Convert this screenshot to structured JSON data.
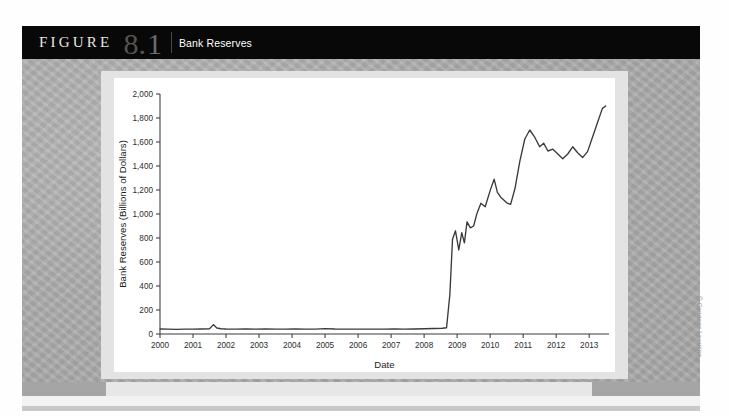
{
  "figure": {
    "label": "FIGURE",
    "chapter": "8",
    "dot": ".",
    "number": "1",
    "title": "Bank Reserves"
  },
  "credit": "© Cengage Learning",
  "chart_data": {
    "type": "line",
    "title": "Bank Reserves",
    "xlabel": "Date",
    "ylabel": "Bank Reserves (Billions of Dollars)",
    "xlim": [
      2000,
      2013.6
    ],
    "ylim": [
      0,
      2000
    ],
    "ytick_labels": [
      "0",
      "200",
      "400",
      "600",
      "800",
      "1,000",
      "1,200",
      "1,400",
      "1,600",
      "1,800",
      "2,000"
    ],
    "ytick_values": [
      0,
      200,
      400,
      600,
      800,
      1000,
      1200,
      1400,
      1600,
      1800,
      2000
    ],
    "xtick_labels": [
      "2000",
      "2001",
      "2002",
      "2003",
      "2004",
      "2005",
      "2006",
      "2007",
      "2008",
      "2009",
      "2010",
      "2011",
      "2012",
      "2013"
    ],
    "xtick_values": [
      2000,
      2001,
      2002,
      2003,
      2004,
      2005,
      2006,
      2007,
      2008,
      2009,
      2010,
      2011,
      2012,
      2013
    ],
    "grid": false,
    "legend": null,
    "series": [
      {
        "name": "Bank Reserves",
        "color": "#3a3a3a",
        "x": [
          2000.0,
          2000.25,
          2000.5,
          2000.75,
          2001.0,
          2001.25,
          2001.5,
          2001.62,
          2001.72,
          2001.85,
          2002.0,
          2002.3,
          2002.6,
          2002.9,
          2003.2,
          2003.5,
          2003.8,
          2004.1,
          2004.4,
          2004.7,
          2005.0,
          2005.3,
          2005.6,
          2005.9,
          2006.2,
          2006.5,
          2006.8,
          2007.1,
          2007.4,
          2007.7,
          2008.0,
          2008.3,
          2008.55,
          2008.68,
          2008.78,
          2008.86,
          2008.95,
          2009.05,
          2009.14,
          2009.22,
          2009.3,
          2009.4,
          2009.5,
          2009.6,
          2009.72,
          2009.85,
          2010.0,
          2010.12,
          2010.22,
          2010.32,
          2010.42,
          2010.52,
          2010.62,
          2010.75,
          2010.9,
          2011.05,
          2011.2,
          2011.35,
          2011.5,
          2011.62,
          2011.75,
          2011.9,
          2012.05,
          2012.2,
          2012.35,
          2012.5,
          2012.65,
          2012.8,
          2012.95,
          2013.1,
          2013.25,
          2013.4,
          2013.5
        ],
        "y": [
          42,
          40,
          38,
          41,
          40,
          42,
          44,
          78,
          50,
          44,
          42,
          40,
          42,
          41,
          42,
          40,
          41,
          42,
          41,
          40,
          45,
          42,
          41,
          40,
          41,
          40,
          41,
          42,
          41,
          42,
          44,
          46,
          48,
          52,
          330,
          790,
          860,
          700,
          845,
          760,
          935,
          885,
          900,
          1005,
          1090,
          1060,
          1195,
          1290,
          1180,
          1140,
          1115,
          1090,
          1080,
          1210,
          1440,
          1625,
          1700,
          1640,
          1560,
          1590,
          1525,
          1540,
          1500,
          1460,
          1500,
          1560,
          1510,
          1470,
          1520,
          1640,
          1760,
          1880,
          1900
        ]
      }
    ]
  }
}
